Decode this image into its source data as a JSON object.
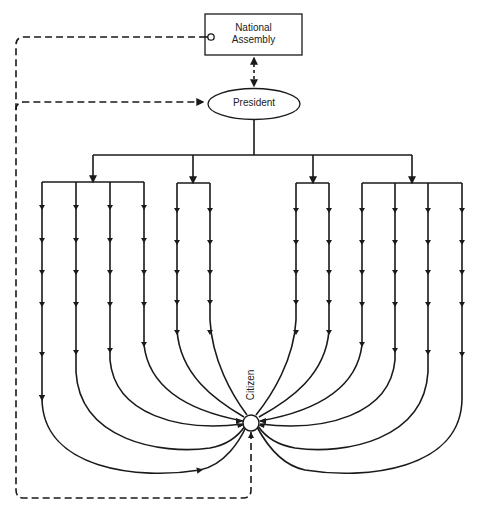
{
  "diagram": {
    "type": "political communication / authority flow diagram",
    "nodes": {
      "assembly": {
        "label_line1": "National",
        "label_line2": "Assembly",
        "shape": "rectangle"
      },
      "president": {
        "label": "President",
        "shape": "ellipse"
      },
      "citizen": {
        "label": "Citizen",
        "shape": "circle"
      }
    },
    "edges": [
      {
        "from": "assembly",
        "to": "president",
        "style": "dotted",
        "direction": "bidirectional"
      },
      {
        "from": "president",
        "to": "citizen",
        "style": "solid",
        "branches": 12,
        "groups": [
          4,
          2,
          2,
          4
        ]
      },
      {
        "from": "citizen",
        "to": "assembly",
        "style": "dashed",
        "direction": "feedback",
        "terminator": "open-circle"
      },
      {
        "from": "citizen",
        "to": "president",
        "style": "dashed",
        "direction": "feedback",
        "terminator": "arrow"
      }
    ],
    "colors": {
      "stroke": "#1a1a1a",
      "background": "#ffffff"
    }
  }
}
